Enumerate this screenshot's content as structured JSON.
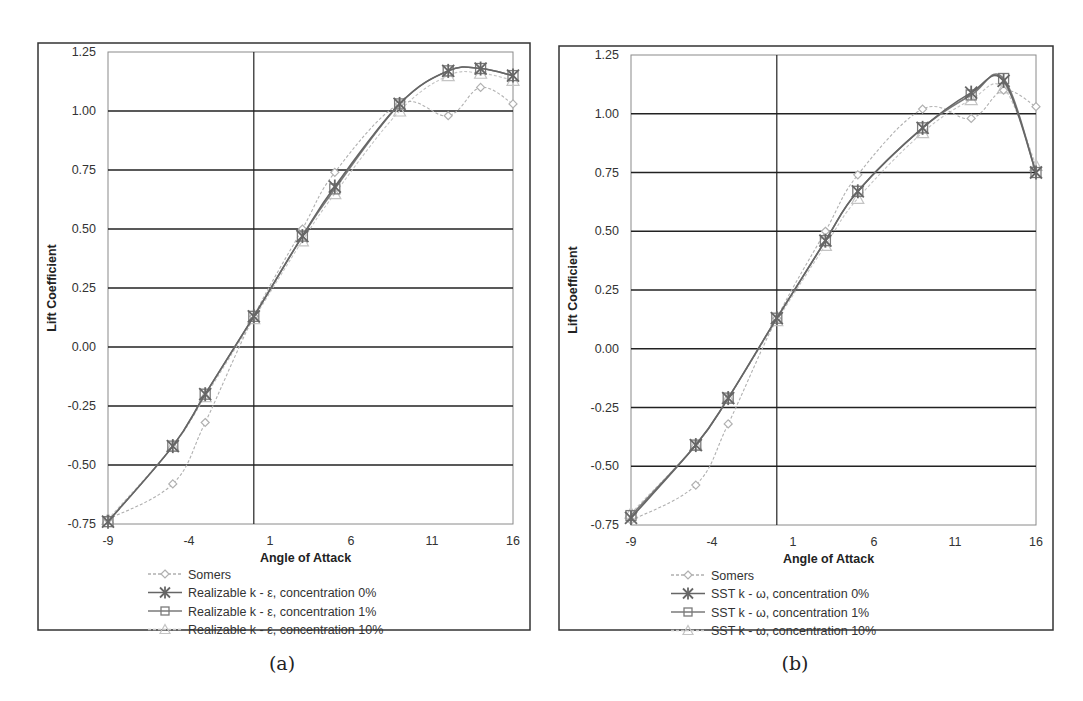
{
  "chart_data": [
    {
      "type": "line",
      "panel": "a",
      "title": "",
      "caption": "(a)",
      "xlabel": "Angle of Attack",
      "ylabel": "Lift Coefficient",
      "xlim": [
        -9,
        16
      ],
      "ylim": [
        -0.75,
        1.25
      ],
      "xticks": [
        "-9",
        "-4",
        "1",
        "6",
        "11",
        "16"
      ],
      "yticks": [
        "1.25",
        "1.00",
        "0.75",
        "0.50",
        "0.25",
        "0.00",
        "-0.25",
        "-0.50",
        "-0.75"
      ],
      "grid": "horizontal major lines + vertical line at x=0",
      "legend_position": "below plot",
      "x": [
        -9,
        -5,
        -3,
        0,
        3,
        5,
        9,
        12,
        14,
        16
      ],
      "series": [
        {
          "name": "Somers",
          "marker": "diamond",
          "style": "dotted",
          "color": "#b0b0b0",
          "values": [
            -0.73,
            -0.58,
            -0.32,
            0.13,
            0.5,
            0.74,
            1.03,
            0.98,
            1.1,
            1.03
          ]
        },
        {
          "name": "Realizable k - ε, concentration 0%",
          "marker": "asterisk",
          "style": "solid",
          "color": "#666666",
          "values": [
            -0.74,
            -0.42,
            -0.2,
            0.13,
            0.47,
            0.68,
            1.03,
            1.17,
            1.18,
            1.15
          ]
        },
        {
          "name": "Realizable k - ε, concentration 1%",
          "marker": "square",
          "style": "solid",
          "color": "#7a7a7a",
          "values": [
            -0.74,
            -0.42,
            -0.2,
            0.13,
            0.47,
            0.67,
            1.03,
            1.17,
            1.18,
            1.15
          ]
        },
        {
          "name": "Realizable k - ε, concentration 10%",
          "marker": "triangle",
          "style": "dotted",
          "color": "#c4c4c4",
          "values": [
            -0.73,
            -0.42,
            -0.21,
            0.12,
            0.45,
            0.65,
            1.0,
            1.15,
            1.16,
            1.13
          ]
        }
      ]
    },
    {
      "type": "line",
      "panel": "b",
      "title": "",
      "caption": "(b)",
      "xlabel": "Angle of Attack",
      "ylabel": "Lift Coefficient",
      "xlim": [
        -9,
        16
      ],
      "ylim": [
        -0.75,
        1.25
      ],
      "xticks": [
        "-9",
        "-4",
        "1",
        "6",
        "11",
        "16"
      ],
      "yticks": [
        "1.25",
        "1.00",
        "0.75",
        "0.50",
        "0.25",
        "0.00",
        "-0.25",
        "-0.50",
        "-0.75"
      ],
      "grid": "horizontal major lines + vertical line at x=0",
      "legend_position": "below plot",
      "x": [
        -9,
        -5,
        -3,
        0,
        3,
        5,
        9,
        12,
        14,
        16
      ],
      "series": [
        {
          "name": "Somers",
          "marker": "diamond",
          "style": "dotted",
          "color": "#b0b0b0",
          "values": [
            -0.73,
            -0.58,
            -0.32,
            0.13,
            0.5,
            0.74,
            1.02,
            0.98,
            1.1,
            1.03
          ]
        },
        {
          "name": "SST k - ω, concentration 0%",
          "marker": "asterisk",
          "style": "solid",
          "color": "#666666",
          "values": [
            -0.72,
            -0.41,
            -0.21,
            0.13,
            0.46,
            0.67,
            0.94,
            1.09,
            1.14,
            0.75
          ]
        },
        {
          "name": "SST k - ω, concentration 1%",
          "marker": "square",
          "style": "solid",
          "color": "#7a7a7a",
          "values": [
            -0.71,
            -0.41,
            -0.21,
            0.13,
            0.46,
            0.67,
            0.94,
            1.08,
            1.15,
            0.75
          ]
        },
        {
          "name": "SST k - ω, concentration 10%",
          "marker": "triangle",
          "style": "dotted",
          "color": "#c4c4c4",
          "values": [
            -0.7,
            -0.41,
            -0.21,
            0.12,
            0.44,
            0.64,
            0.92,
            1.06,
            1.11,
            0.78
          ]
        }
      ]
    }
  ],
  "panels": {
    "a": {
      "caption": "(a)",
      "xlabel": "Angle of Attack",
      "ylabel": "Lift Coefficient",
      "legend": [
        "Somers",
        "Realizable k - ε, concentration 0%",
        "Realizable k - ε, concentration 1%",
        "Realizable k - ε, concentration 10%"
      ]
    },
    "b": {
      "caption": "(b)",
      "xlabel": "Angle of Attack",
      "ylabel": "Lift Coefficient",
      "legend": [
        "Somers",
        "SST k - ω, concentration 0%",
        "SST k - ω, concentration 1%",
        "SST k - ω, concentration 10%"
      ]
    }
  },
  "colors": {
    "frame": "#333333",
    "gridline": "#222222",
    "plot_border": "#8a8a8a",
    "text": "#333333"
  }
}
